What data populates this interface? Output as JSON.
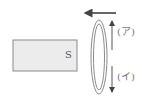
{
  "diagram": {
    "magnet": {
      "pole_label": "S",
      "fill": "#ececec",
      "stroke": "#8a8a8a"
    },
    "motion_arrow": {
      "direction": "left"
    },
    "coil": {
      "stroke": "#8a8a8a"
    },
    "current_labels": [
      {
        "label": "(ア)",
        "direction": "up"
      },
      {
        "label": "(イ)",
        "direction": "down"
      }
    ]
  }
}
